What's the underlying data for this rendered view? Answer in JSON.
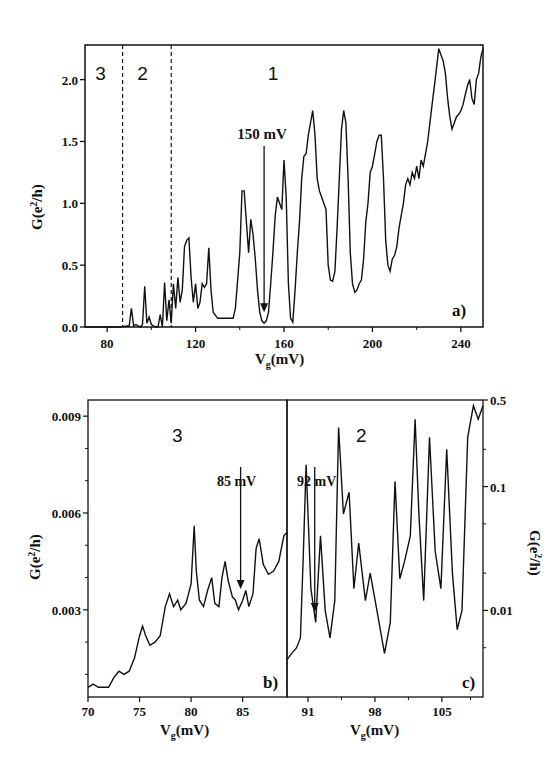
{
  "chart_data": [
    {
      "panel": "a",
      "type": "line",
      "panel_label": "a)",
      "xlabel": "V_g(mV)",
      "ylabel": "G(e^2/h)",
      "xlim": [
        70,
        250
      ],
      "ylim": [
        0,
        2.28
      ],
      "xticks": [
        80,
        120,
        160,
        200,
        240
      ],
      "yticks": [
        0.0,
        0.5,
        1.0,
        1.5,
        2.0
      ],
      "ytick_labels": [
        "0.0",
        "0.5",
        "1.0",
        "1.5",
        "2.0"
      ],
      "region_labels": [
        {
          "text": "3",
          "x": 77
        },
        {
          "text": "2",
          "x": 96
        },
        {
          "text": "1",
          "x": 155
        }
      ],
      "dividers": [
        87,
        109
      ],
      "annotation": {
        "text": "150 mV",
        "x": 151,
        "arrow_tip_y": 0.12,
        "arrow_top_y": 1.53
      },
      "x": [
        70,
        86,
        90,
        91,
        92,
        93,
        94,
        95,
        96,
        97,
        98,
        99,
        100,
        101,
        102,
        103,
        104,
        105,
        106,
        107,
        108,
        109,
        110,
        111,
        112,
        113,
        114,
        115,
        116,
        117,
        118,
        119,
        120,
        121,
        122,
        123,
        124,
        125,
        126,
        127,
        128,
        130,
        132,
        135,
        137,
        138,
        140,
        141,
        142,
        143,
        144,
        145,
        146,
        147,
        148,
        149,
        150,
        151,
        152,
        153,
        154,
        155,
        156,
        157,
        158,
        159,
        160,
        161,
        162,
        163,
        164,
        165,
        166,
        167,
        168,
        169,
        170,
        171,
        172,
        173,
        174,
        175,
        176,
        177,
        178,
        179,
        180,
        181,
        182,
        183,
        184,
        185,
        186,
        187,
        188,
        189,
        190,
        191,
        192,
        193,
        194,
        195,
        196,
        197,
        198,
        199,
        200,
        201,
        202,
        203,
        204,
        205,
        206,
        207,
        208,
        209,
        210,
        211,
        212,
        213,
        214,
        215,
        216,
        217,
        218,
        219,
        220,
        221,
        222,
        223,
        224,
        225,
        226,
        227,
        228,
        229,
        230,
        231,
        232,
        233,
        234,
        235,
        236,
        237,
        238,
        239,
        240,
        241,
        242,
        243,
        244,
        245,
        246,
        247,
        248,
        249,
        250
      ],
      "values": [
        0,
        0,
        0.01,
        0.15,
        0.01,
        0.02,
        0.01,
        0.0,
        0.02,
        0.33,
        0.03,
        0.08,
        0.02,
        0.01,
        0.0,
        0.0,
        0.1,
        0.0,
        0.36,
        0.05,
        0.22,
        0.03,
        0.35,
        0.15,
        0.4,
        0.2,
        0.3,
        0.65,
        0.7,
        0.72,
        0.4,
        0.2,
        0.35,
        0.15,
        0.2,
        0.35,
        0.32,
        0.35,
        0.64,
        0.3,
        0.12,
        0.07,
        0.07,
        0.07,
        0.07,
        0.15,
        0.6,
        1.1,
        1.1,
        0.85,
        0.6,
        0.87,
        0.75,
        0.55,
        0.3,
        0.12,
        0.05,
        0.03,
        0.05,
        0.12,
        0.35,
        0.6,
        0.9,
        1.05,
        1.0,
        0.95,
        1.35,
        1.05,
        0.35,
        0.07,
        0.04,
        0.3,
        0.6,
        0.85,
        1.2,
        1.38,
        1.4,
        1.55,
        1.65,
        1.75,
        1.55,
        1.2,
        1.1,
        1.05,
        1.0,
        0.95,
        0.5,
        0.38,
        0.37,
        0.45,
        0.8,
        1.2,
        1.6,
        1.75,
        1.65,
        1.2,
        0.6,
        0.35,
        0.28,
        0.3,
        0.35,
        0.38,
        0.55,
        0.85,
        1.0,
        1.25,
        1.3,
        1.4,
        1.5,
        1.55,
        1.55,
        1.2,
        0.7,
        0.5,
        0.45,
        0.55,
        0.58,
        0.65,
        0.8,
        0.9,
        1.0,
        1.15,
        1.2,
        1.15,
        1.25,
        1.2,
        1.3,
        1.2,
        1.35,
        1.3,
        1.4,
        1.5,
        1.65,
        1.8,
        1.95,
        2.1,
        2.25,
        2.2,
        2.15,
        2.05,
        1.85,
        1.7,
        1.6,
        1.65,
        1.7,
        1.72,
        1.75,
        1.8,
        1.88,
        1.95,
        2.0,
        1.85,
        1.8,
        2.0,
        2.05,
        2.18,
        2.25
      ]
    },
    {
      "panel": "b",
      "type": "line",
      "panel_label": "b)",
      "xlabel": "V_g(mV)",
      "ylabel": "G(e^2/h)",
      "yscale": "linear",
      "xlim": [
        70,
        89.3
      ],
      "ylim": [
        0.0003,
        0.0095
      ],
      "xticks": [
        70,
        75,
        80,
        85
      ],
      "yticks": [
        0.003,
        0.006,
        0.009
      ],
      "ytick_labels": [
        "0.003",
        "0.006",
        "0.009"
      ],
      "region_label": "3",
      "annotation": {
        "text": "85 mV",
        "x": 84.8
      },
      "x": [
        70,
        70.5,
        71,
        72,
        72.5,
        73,
        73.5,
        74,
        74.5,
        75,
        75.3,
        75.6,
        76,
        76.5,
        77,
        77.5,
        77.9,
        78.3,
        78.7,
        79,
        79.5,
        80,
        80.3,
        80.5,
        80.8,
        81.2,
        81.6,
        82,
        82.3,
        82.7,
        83,
        83.3,
        83.6,
        84,
        84.3,
        84.6,
        85,
        85.3,
        85.6,
        86,
        86.3,
        86.6,
        87,
        87.5,
        88,
        88.5,
        89,
        89.3
      ],
      "values": [
        0.0006,
        0.0007,
        0.0006,
        0.0006,
        0.0009,
        0.0011,
        0.001,
        0.0011,
        0.0015,
        0.0022,
        0.0025,
        0.0022,
        0.0019,
        0.002,
        0.0022,
        0.0031,
        0.0035,
        0.0031,
        0.0033,
        0.003,
        0.0032,
        0.0038,
        0.0056,
        0.0042,
        0.0033,
        0.0031,
        0.0036,
        0.004,
        0.0032,
        0.0031,
        0.004,
        0.0045,
        0.0039,
        0.0034,
        0.0033,
        0.003,
        0.0033,
        0.0036,
        0.0031,
        0.0035,
        0.0049,
        0.0052,
        0.0044,
        0.0041,
        0.0042,
        0.0045,
        0.0053,
        0.0054
      ]
    },
    {
      "panel": "c",
      "type": "line",
      "panel_label": "c)",
      "xlabel": "V_g(mV)",
      "ylabel": "G(e^2/h)",
      "yscale": "log",
      "xlim": [
        88.8,
        109.3
      ],
      "ylim": [
        0.002,
        0.5
      ],
      "xticks": [
        91,
        98,
        105
      ],
      "yticks": [
        0.01,
        0.1,
        0.5
      ],
      "ytick_labels": [
        "0.01",
        "0.1",
        "0.5"
      ],
      "region_label": "2",
      "annotation": {
        "text": "92 mV",
        "x": 91.7
      },
      "x": [
        88.8,
        89.3,
        89.8,
        90.2,
        90.5,
        90.8,
        91.3,
        91.8,
        92.3,
        92.8,
        93.3,
        93.8,
        94.2,
        94.7,
        95.3,
        95.8,
        96.3,
        97.0,
        97.5,
        98.2,
        99.0,
        99.6,
        100.1,
        100.6,
        101.1,
        101.7,
        102.2,
        102.6,
        103.1,
        103.7,
        104.3,
        104.9,
        105.5,
        106.1,
        106.6,
        107.1,
        107.7,
        108.3,
        108.8,
        109.3
      ],
      "values": [
        0.004,
        0.0045,
        0.005,
        0.006,
        0.028,
        0.15,
        0.015,
        0.008,
        0.04,
        0.01,
        0.006,
        0.012,
        0.3,
        0.06,
        0.09,
        0.015,
        0.035,
        0.012,
        0.02,
        0.01,
        0.0045,
        0.008,
        0.11,
        0.018,
        0.025,
        0.04,
        0.35,
        0.06,
        0.012,
        0.25,
        0.03,
        0.015,
        0.2,
        0.02,
        0.007,
        0.01,
        0.25,
        0.45,
        0.35,
        0.45
      ]
    }
  ]
}
